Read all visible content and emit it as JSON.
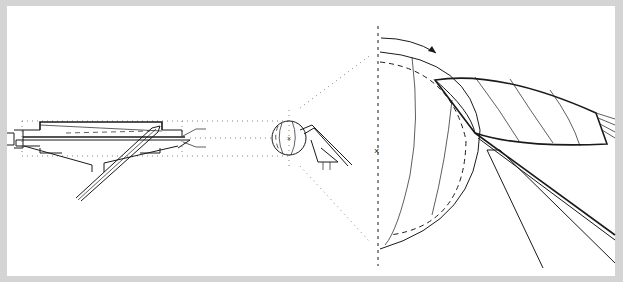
{
  "figure": {
    "title": "",
    "colors": {
      "background": "#ffffff",
      "border": "#d4d4d4",
      "line": "#1a1a1a",
      "projection": "#777777"
    },
    "components": [
      {
        "id": "part-side-view",
        "label": "Conical part side view with inclined tool"
      },
      {
        "id": "sphere-detail",
        "label": "Small sphere detail with center mark"
      },
      {
        "id": "projection-lines",
        "label": "Dotted projection lines"
      },
      {
        "id": "enlarged-view",
        "label": "Enlarged hemispherical cutter view"
      },
      {
        "id": "rotation-axis",
        "label": "Vertical dashed rotation axis with center mark"
      },
      {
        "id": "rotation-arrow",
        "label": "Curved rotation direction arrow"
      },
      {
        "id": "blade",
        "label": "Curved blade with hatch lines"
      },
      {
        "id": "tool-shank",
        "label": "Inclined tool shank lines"
      }
    ],
    "center_mark_symbol": "×"
  }
}
